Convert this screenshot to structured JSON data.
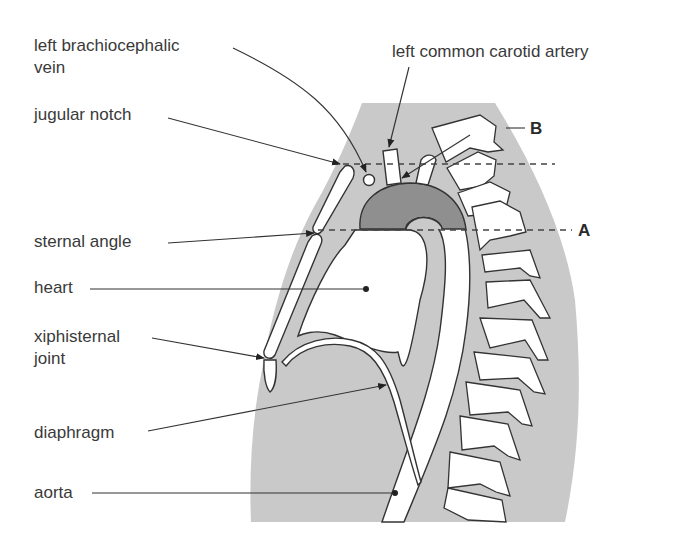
{
  "figure": {
    "type": "anatomical sagittal section of thorax",
    "top_cutoff_text": "",
    "labels": {
      "left_brachiocephalic_vein_line1": "left brachiocephalic",
      "left_brachiocephalic_vein_line2": "vein",
      "jugular_notch": "jugular notch",
      "sternal_angle": "sternal angle",
      "heart": "heart",
      "xiphisternal_joint_line1": "xiphisternal",
      "xiphisternal_joint_line2": "joint",
      "diaphragm": "diaphragm",
      "aorta": "aorta",
      "left_common_carotid_artery": "left common carotid artery",
      "plane_a": "A",
      "plane_b": "B"
    },
    "colors": {
      "body_fill": "#c9c9c9",
      "aortic_arch_fill": "#8f8f8f",
      "bone_fill": "#ffffff",
      "outline": "#333333",
      "text": "#3a3a3a"
    }
  }
}
